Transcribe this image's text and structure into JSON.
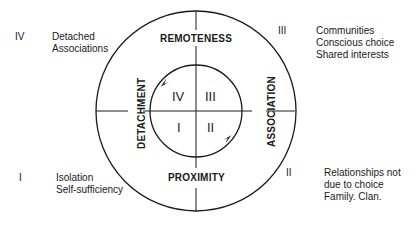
{
  "diagram": {
    "axes": {
      "top": "REMOTENESS",
      "bottom": "PROXIMITY",
      "left": "DETACHMENT",
      "right": "ASSOCIATION"
    },
    "inner_quadrants": {
      "top_left": "IV",
      "top_right": "III",
      "bottom_left": "I",
      "bottom_right": "II"
    },
    "outer_annotations": [
      {
        "position": "top-left",
        "numeral": "IV",
        "lines": [
          "Detached",
          "Associations"
        ]
      },
      {
        "position": "top-right",
        "numeral": "III",
        "lines": [
          "Communities",
          "Conscious choice",
          "Shared interests"
        ]
      },
      {
        "position": "bottom-left",
        "numeral": "I",
        "lines": [
          "Isolation",
          "Self-sufficiency"
        ]
      },
      {
        "position": "bottom-right",
        "numeral": "II",
        "lines": [
          "Relationships not",
          "due to choice",
          "Family. Clan."
        ]
      }
    ],
    "colors": {
      "line": "#1a1a1a",
      "background": "#ffffff"
    }
  }
}
